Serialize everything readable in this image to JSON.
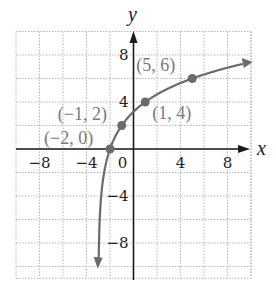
{
  "chart_data": {
    "type": "line",
    "title": "",
    "xlabel": "x",
    "ylabel": "y",
    "xlim": [
      -10,
      10
    ],
    "ylim": [
      -11,
      10
    ],
    "grid": true,
    "grid_step": 2,
    "x_ticks": [
      {
        "value": -8,
        "label": "−8"
      },
      {
        "value": -4,
        "label": "−4"
      },
      {
        "value": 0,
        "label": "0"
      },
      {
        "value": 4,
        "label": "4"
      },
      {
        "value": 8,
        "label": "8"
      }
    ],
    "y_ticks": [
      {
        "value": 8,
        "label": "8"
      },
      {
        "value": 4,
        "label": "4"
      },
      {
        "value": -4,
        "label": "−4"
      },
      {
        "value": -8,
        "label": "−8"
      }
    ],
    "series": [
      {
        "name": "curve",
        "function": "y = 2·log2(x + 3)",
        "points": [
          {
            "x": -2,
            "y": 0,
            "label": "(−2, 0)"
          },
          {
            "x": -1,
            "y": 2,
            "label": "(−1, 2)"
          },
          {
            "x": 1,
            "y": 4,
            "label": "(1, 4)"
          },
          {
            "x": 5,
            "y": 6,
            "label": "(5, 6)"
          }
        ],
        "arrows": "both ends"
      }
    ]
  },
  "colors": {
    "curve": "#6b6b6b",
    "point": "#6b6b6b",
    "grid": "#b5b5b5",
    "axis": "#1a1a1a",
    "label": "#7a7a7a"
  }
}
